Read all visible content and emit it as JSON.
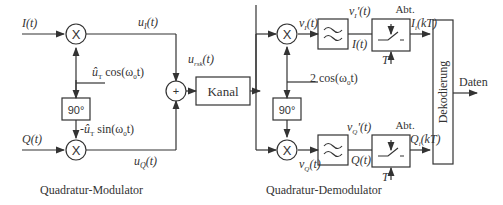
{
  "modulator": {
    "caption": "Quadratur-Modulator",
    "input_i": "I(t)",
    "input_q": "Q(t)",
    "u_i": "u",
    "u_i_sub": "I",
    "u_i_tail": "(t)",
    "u_q": "u",
    "u_q_sub": "Q",
    "u_q_tail": "(t)",
    "carrier_cos": "û",
    "carrier_cos_sub": "T",
    "carrier_cos_tail": " cos(ω",
    "carrier_cos_sub2": "0",
    "carrier_cos_end": "t)",
    "carrier_sin": "-û",
    "carrier_sin_sub": "T",
    "carrier_sin_tail": " sin(ω",
    "carrier_sin_sub2": "0",
    "carrier_sin_end": "t)",
    "phase_shift": "90°",
    "mixer_symbol": "X",
    "adder_symbol": "+",
    "sum_signal": "u",
    "sum_signal_sub": "rsk",
    "sum_signal_tail": "(t)"
  },
  "channel": {
    "label": "Kanal"
  },
  "demodulator": {
    "caption": "Quadratur-Demodulator",
    "carrier": "2 cos(ω",
    "carrier_sub": "0",
    "carrier_end": "t)",
    "phase_shift": "90°",
    "mixer_symbol": "X",
    "v_i": "v",
    "v_i_sub": "I",
    "v_i_tail": "(t)",
    "v_i_prime": "v",
    "v_i_prime_sub": "I",
    "v_i_prime_tail": "'(t)",
    "i_t": "I(t)",
    "v_q": "v",
    "v_q_sub": "Q",
    "v_q_tail": "(t)",
    "v_q_prime": "v",
    "v_q_prime_sub": "Q",
    "v_q_prime_tail": "'(t)",
    "q_t": "Q(t)",
    "sampler_label": "Abt.",
    "sample_period": "T",
    "i_kt": "I",
    "i_kt_sub": "i",
    "i_kt_tail": "(kT)",
    "q_kt": "Q",
    "q_kt_sub": "i",
    "q_kt_tail": "(kT)"
  },
  "decoder": {
    "label": "Dekodierung",
    "output": "Daten"
  }
}
